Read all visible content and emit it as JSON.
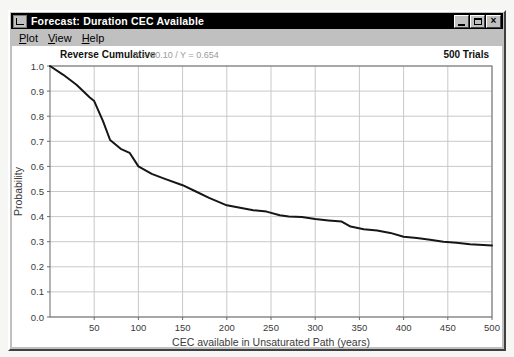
{
  "window": {
    "title": "Forecast: Duration CEC Available",
    "icons": {
      "window_icon": "forecast-chart-icon",
      "minimize": "minimize-icon",
      "maximize": "maximize-icon",
      "close": "close-icon"
    }
  },
  "menu": {
    "items": [
      {
        "label": "Plot"
      },
      {
        "label": "View"
      },
      {
        "label": "Help"
      }
    ]
  },
  "chart_header": {
    "type_label": "Reverse Cumulative",
    "crosshair_readout": "X = 90.10 / Y = 0.654",
    "trials": "500 Trials"
  },
  "colors": {
    "window_chrome": "#c0c0c0",
    "titlebar": "#000000",
    "titlebar_text": "#ffffff",
    "plot_background": "#ffffff",
    "gridline": "#c9c9c9",
    "plot_border": "#6b6b6b",
    "curve": "#161616",
    "tick_text": "#3a3a3a",
    "readout_text": "#9b9b9b"
  },
  "chart_data": {
    "type": "line",
    "title": "Reverse Cumulative",
    "subtitle": "500 Trials",
    "xlabel": "CEC available in Unsaturated Path (years)",
    "ylabel": "Probability",
    "xlim": [
      0,
      500
    ],
    "ylim": [
      0,
      1.0
    ],
    "grid": true,
    "legend": "none",
    "x_ticks": [
      50,
      100,
      150,
      200,
      250,
      300,
      350,
      400,
      450,
      500
    ],
    "y_ticks": [
      {
        "value": 1.0,
        "label": "1.0"
      },
      {
        "value": 0.9,
        "label": "0.9"
      },
      {
        "value": 0.8,
        "label": "0.8"
      },
      {
        "value": 0.7,
        "label": "0.7"
      },
      {
        "value": 0.6,
        "label": "0.6"
      },
      {
        "value": 0.5,
        "label": "0.5"
      },
      {
        "value": 0.4,
        "label": "0.4"
      },
      {
        "value": 0.3,
        "label": "0.3"
      },
      {
        "value": 0.2,
        "label": "0.2"
      },
      {
        "value": 0.1,
        "label": "0.1"
      },
      {
        "value": 0.0,
        "label": "0.0"
      }
    ],
    "series": [
      {
        "name": "Reverse Cumulative",
        "x": [
          0,
          15,
          30,
          45,
          50,
          60,
          68,
          80,
          90,
          100,
          115,
          130,
          150,
          165,
          180,
          200,
          215,
          230,
          245,
          260,
          270,
          285,
          300,
          315,
          330,
          340,
          355,
          370,
          385,
          400,
          415,
          430,
          445,
          460,
          475,
          490,
          500
        ],
        "y": [
          1.0,
          0.965,
          0.925,
          0.875,
          0.86,
          0.78,
          0.705,
          0.67,
          0.654,
          0.6,
          0.57,
          0.55,
          0.525,
          0.5,
          0.475,
          0.445,
          0.435,
          0.425,
          0.42,
          0.405,
          0.4,
          0.398,
          0.39,
          0.385,
          0.38,
          0.36,
          0.35,
          0.345,
          0.335,
          0.32,
          0.315,
          0.308,
          0.3,
          0.296,
          0.29,
          0.287,
          0.285
        ]
      }
    ]
  }
}
